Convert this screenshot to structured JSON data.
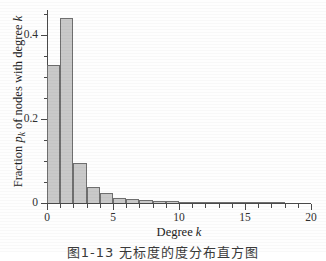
{
  "chart_data": {
    "type": "bar",
    "title": "",
    "xlabel": "Degree k",
    "ylabel": "Fraction p_k of nodes with degree k",
    "xlim": [
      0,
      20
    ],
    "ylim": [
      0,
      0.46
    ],
    "grid": false,
    "legend": null,
    "bar_width_in_x_units": 1,
    "categories": [
      1,
      2,
      3,
      4,
      5,
      6,
      7,
      8,
      9,
      10,
      11,
      12,
      13,
      14,
      15,
      16,
      17,
      18
    ],
    "values": [
      0.33,
      0.44,
      0.096,
      0.038,
      0.023,
      0.013,
      0.009,
      0.007,
      0.005,
      0.005,
      0.003,
      0.002,
      0.002,
      0.002,
      0.001,
      0.001,
      0.001,
      0.001
    ],
    "x_ticks": [
      0,
      5,
      10,
      15,
      20
    ],
    "x_tick_labels": [
      "0",
      "5",
      "10",
      "15",
      "20"
    ],
    "x_minor_ticks": [
      1,
      2,
      3,
      4,
      6,
      7,
      8,
      9,
      11,
      12,
      13,
      14,
      16,
      17,
      18,
      19
    ],
    "y_ticks": [
      0,
      0.2,
      0.4
    ],
    "y_tick_labels": [
      "0",
      "0.2",
      "0.4"
    ],
    "y_minor_ticks": [
      0.05,
      0.1,
      0.15,
      0.25,
      0.3,
      0.35,
      0.45
    ],
    "bar_fill_color": "#c9c9c9",
    "bar_edge_color": "#6f6f6f",
    "axis_color": "#4a4a4a"
  },
  "axis_titles": {
    "x_prefix": "Degree ",
    "x_symbol": "k",
    "y_part1": "Fraction ",
    "y_symbol": "p",
    "y_subscript": "k",
    "y_part2": " of nodes with degree ",
    "y_symbol2": "k"
  },
  "caption": {
    "text": "图1-13 无标度的度分布直方图"
  }
}
